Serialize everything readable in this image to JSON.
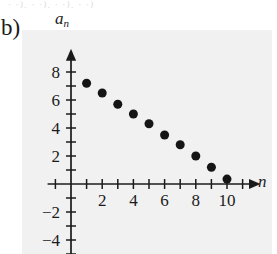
{
  "panel": {
    "label": "b)"
  },
  "clipped_text": {
    "content": "· ·), · ·), · ·),        · ·)"
  },
  "axes": {
    "x_label": "n",
    "y_label_base": "a",
    "y_label_sub": "n",
    "x_ticks_labeled": [
      "2",
      "4",
      "6",
      "8",
      "10"
    ],
    "x_tick_values": [
      2,
      4,
      6,
      8,
      10
    ],
    "y_ticks_labeled": [
      "8",
      "6",
      "4",
      "2",
      "−2",
      "−4"
    ],
    "y_tick_values": [
      8,
      6,
      4,
      2,
      -2,
      -4
    ],
    "x_range": [
      -1.5,
      12
    ],
    "y_range": [
      -5,
      9.5
    ],
    "x_minor_step": 1,
    "y_minor_step": 1,
    "arrow_x": true,
    "arrow_y": true
  },
  "style": {
    "ink": "#1b1b1b",
    "point_fill": "#151515",
    "plot_tint": "#f1f1f2",
    "page_background": "#ffffff"
  },
  "chart_data": {
    "type": "scatter",
    "title": "",
    "subtitle": "",
    "xlabel": "n",
    "ylabel": "a_n",
    "grid": false,
    "legend": "none",
    "xlim": [
      -1.5,
      12
    ],
    "ylim": [
      -5,
      9.5
    ],
    "xticks": [
      2,
      4,
      6,
      8,
      10
    ],
    "yticks": [
      -4,
      -2,
      2,
      4,
      6,
      8
    ],
    "x": [
      1,
      2,
      3,
      4,
      5,
      6,
      7,
      8,
      9,
      10
    ],
    "y": [
      7.2,
      6.5,
      5.7,
      5.0,
      4.3,
      3.5,
      2.8,
      2.0,
      1.2,
      0.35
    ],
    "series": [
      {
        "name": "a_n",
        "x": [
          1,
          2,
          3,
          4,
          5,
          6,
          7,
          8,
          9,
          10
        ],
        "values": [
          7.2,
          6.5,
          5.7,
          5.0,
          4.3,
          3.5,
          2.8,
          2.0,
          1.2,
          0.35
        ]
      }
    ],
    "marker": "filled-circle",
    "marker_color": "#151515",
    "marker_size": 9,
    "annotations": []
  }
}
